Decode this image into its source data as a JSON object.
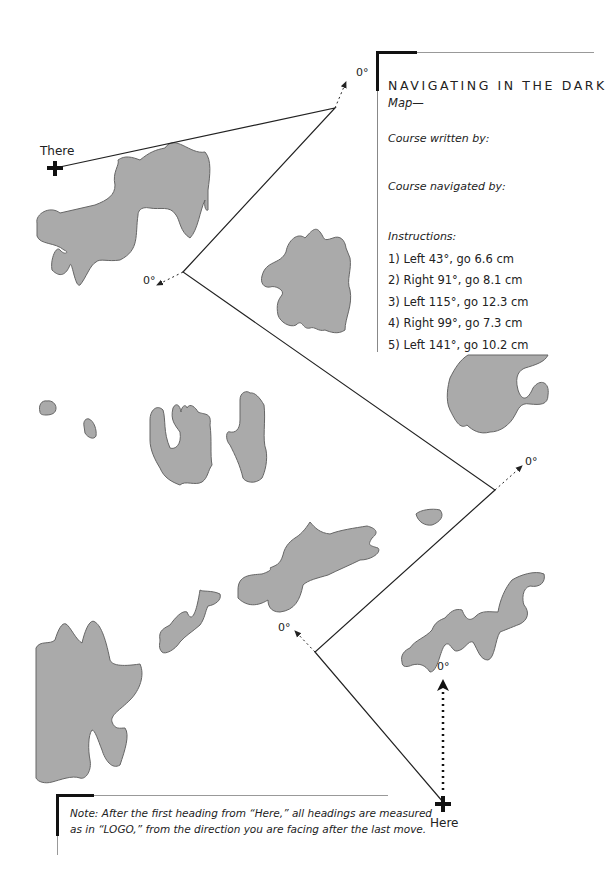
{
  "title": "NAVIGATING IN THE DARK",
  "subtitle": "Map—",
  "course_written_label": "Course written by:",
  "course_navigated_label": "Course navigated by:",
  "instructions_label": "Instructions:",
  "instructions": [
    "1) Left 43°, go 6.6 cm",
    "2) Right 91°, go 8.1 cm",
    "3) Left 115°, go 12.3 cm",
    "4) Right 99°, go 7.3 cm",
    "5) Left 141°, go 10.2 cm"
  ],
  "note": {
    "line1": "Note: After the first heading from “Here,” all headings are measured",
    "line2": "as in “LOGO,” from the direction you are facing after the last move."
  },
  "labels": {
    "start": "Here",
    "end": "There",
    "heading": "0°"
  },
  "colors": {
    "land": "#aaaaaa",
    "land_stroke": "#666666",
    "path": "#222222"
  }
}
